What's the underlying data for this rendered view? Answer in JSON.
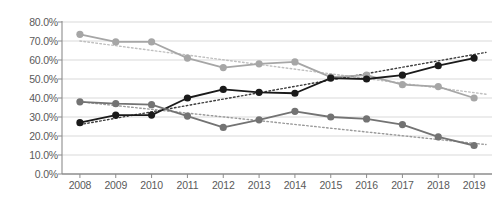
{
  "chart_data": {
    "type": "line",
    "title": "",
    "subtitle": "",
    "xlabel": "",
    "ylabel": "",
    "categories": [
      "2008",
      "2009",
      "2010",
      "2011",
      "2012",
      "2013",
      "2014",
      "2015",
      "2016",
      "2017",
      "2018",
      "2019"
    ],
    "ylim": [
      0,
      80
    ],
    "ytick_values": [
      0,
      10,
      20,
      30,
      40,
      50,
      60,
      70,
      80
    ],
    "ytick_labels": [
      "0.0%",
      "10.0%",
      "20.0%",
      "30.0%",
      "40.0%",
      "50.0%",
      "60.0%",
      "70.0%",
      "80.0%"
    ],
    "grid": true,
    "grid_axis": "y",
    "legend": false,
    "legend_position": "none",
    "value_suffix": "%",
    "series": [
      {
        "name": "light-gray-series",
        "color": "#a6a6a6",
        "marker": "circle",
        "values": [
          73.5,
          69.5,
          69.5,
          61.0,
          56.0,
          58.0,
          59.0,
          51.0,
          52.0,
          47.0,
          46.0,
          40.0
        ],
        "trendline": {
          "style": "dotted",
          "color": "#bfbfbf",
          "start_value": 70.0,
          "end_value": 42.0
        }
      },
      {
        "name": "black-series",
        "color": "#1a1a1a",
        "marker": "circle",
        "values": [
          27.0,
          31.0,
          31.0,
          40.0,
          44.5,
          43.0,
          42.5,
          50.5,
          50.0,
          52.0,
          57.0,
          61.0
        ],
        "trendline": {
          "style": "dotted",
          "color": "#3d3d3d",
          "start_value": 26.0,
          "end_value": 64.0
        }
      },
      {
        "name": "medium-gray-series",
        "color": "#737373",
        "marker": "circle",
        "values": [
          38.0,
          37.0,
          36.5,
          30.5,
          24.5,
          28.5,
          33.0,
          30.0,
          29.0,
          26.0,
          19.5,
          15.0
        ],
        "trendline": {
          "style": "dotted",
          "color": "#9a9a9a",
          "start_value": 38.0,
          "end_value": 15.5
        }
      }
    ]
  },
  "axes": {
    "axis_line_color": "#8c8c8c",
    "gridline_color": "#d9d9d9",
    "tick_label_color": "#5a5a5a"
  }
}
